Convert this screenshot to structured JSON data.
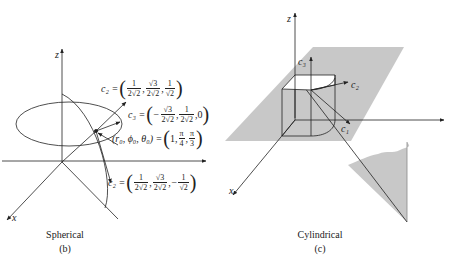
{
  "figure_b": {
    "caption": "Spherical",
    "sublabel": "(b)",
    "axis_z": "z",
    "axis_x": "x",
    "e2_upper": {
      "lhs": "c₂ =",
      "f1n": "1",
      "f1d": "2√2",
      "f2n": "√3",
      "f2d": "2√2",
      "f3n": "1",
      "f3d": "√2",
      "sep": ","
    },
    "e3": {
      "lhs": "c₃ =",
      "sign": "−",
      "f1n": "√3",
      "f1d": "2√2",
      "f2n": "1",
      "f2d": "2√2",
      "last": "0",
      "sep": ","
    },
    "point": {
      "lhs": "(r₀, ϕ₀, θ₀) =",
      "first": "1",
      "f1n": "π",
      "f1d": "4",
      "f2n": "π",
      "f2d": "3",
      "sep": ","
    },
    "e2_lower": {
      "lhs": "c₂ =",
      "f1n": "1",
      "f1d": "2√2",
      "f2n": "√3",
      "f2d": "2√2",
      "sign": "−",
      "f3n": "1",
      "f3d": "√2",
      "sep": ","
    }
  },
  "figure_c": {
    "caption": "Cylindrical",
    "sublabel": "(c)",
    "axis_z": "z",
    "axis_x": "x",
    "vec_c3": "c₃",
    "vec_c2": "c₂",
    "vec_c1": "c₁"
  },
  "colors": {
    "shade": "#c8c8c8",
    "line": "#222222"
  }
}
